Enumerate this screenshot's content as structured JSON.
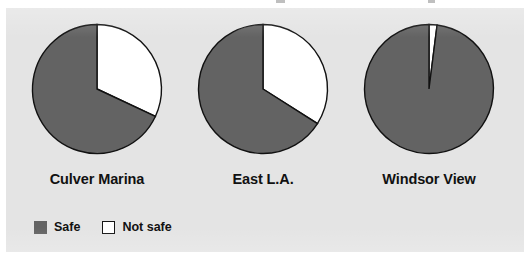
{
  "panel": {
    "background_color": "#e4e4e4",
    "page_background_color": "#ffffff"
  },
  "legend": {
    "items": [
      {
        "label": "Safe",
        "swatch": "safe",
        "color": "#636363"
      },
      {
        "label": "Not safe",
        "swatch": "notsafe",
        "color": "#ffffff"
      }
    ]
  },
  "chart_data": {
    "type": "pie",
    "title": "",
    "subtitle": "",
    "xlabel": "",
    "ylabel": "",
    "legend_position": "bottom-left",
    "grid": false,
    "categories": [
      "Safe",
      "Not safe"
    ],
    "colors": {
      "Safe": "#636363",
      "Not safe": "#ffffff"
    },
    "slice_outline_color": "#111111",
    "charts": [
      {
        "label": "Culver Marina",
        "slices": [
          {
            "name": "Not safe",
            "value": 32,
            "start_angle": 0,
            "end_angle": 115.2
          },
          {
            "name": "Safe",
            "value": 68,
            "start_angle": 115.2,
            "end_angle": 360
          }
        ]
      },
      {
        "label": "East L.A.",
        "slices": [
          {
            "name": "Not safe",
            "value": 34,
            "start_angle": 0,
            "end_angle": 122.4
          },
          {
            "name": "Safe",
            "value": 66,
            "start_angle": 122.4,
            "end_angle": 360
          }
        ]
      },
      {
        "label": "Windsor View",
        "slices": [
          {
            "name": "Not safe",
            "value": 2,
            "start_angle": 0,
            "end_angle": 7.2
          },
          {
            "name": "Safe",
            "value": 98,
            "start_angle": 7.2,
            "end_angle": 360
          }
        ]
      }
    ]
  }
}
